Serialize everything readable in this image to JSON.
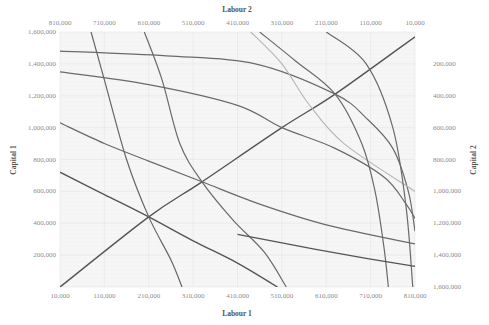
{
  "chart_data": {
    "type": "line",
    "title": "",
    "subtitle": "Edgeworth box: isoquants for two producers with contract curve",
    "xlabel": "Labour 1",
    "ylabel": "Capital 1",
    "x2label": "Labour 2",
    "y2label": "Capital 2",
    "xlim": [
      10000,
      810000
    ],
    "ylim": [
      0,
      1600000
    ],
    "x2lim": [
      810000,
      10000
    ],
    "y2lim": [
      1600000,
      0
    ],
    "grid": true,
    "legend": "none",
    "x_ticks": [
      "10,000",
      "110,000",
      "210,000",
      "310,000",
      "410,000",
      "510,000",
      "610,000",
      "710,000",
      "810,000"
    ],
    "y_ticks": [
      "",
      "200,000",
      "400,000",
      "600,000",
      "800,000",
      "1,000,000",
      "1,200,000",
      "1,400,000",
      "1,600,000"
    ],
    "x2_ticks": [
      "810,000",
      "710,000",
      "610,000",
      "510,000",
      "410,000",
      "310,000",
      "210,000",
      "110,000",
      "10,000"
    ],
    "y2_ticks": [
      "",
      "200,000",
      "400,000",
      "600,000",
      "800,000",
      "1,000,000",
      "1,200,000",
      "1,400,000",
      "1,600,000"
    ],
    "series": [
      {
        "name": "Contract curve",
        "color": "#555555",
        "width": 1.4,
        "points": [
          [
            10000,
            0
          ],
          [
            210000,
            440000
          ],
          [
            330000,
            660000
          ],
          [
            510000,
            1000000
          ],
          [
            630000,
            1210000
          ],
          [
            810000,
            1570000
          ]
        ]
      },
      {
        "name": "Isoquant 1a",
        "color": "#555555",
        "width": 1.4,
        "points": [
          [
            10000,
            720000
          ],
          [
            110000,
            580000
          ],
          [
            210000,
            440000
          ],
          [
            310000,
            290000
          ],
          [
            410000,
            150000
          ],
          [
            500000,
            0
          ]
        ]
      },
      {
        "name": "Isoquant 1b",
        "color": "#6a6a6a",
        "width": 1.2,
        "points": [
          [
            10000,
            1030000
          ],
          [
            110000,
            900000
          ],
          [
            210000,
            790000
          ],
          [
            330000,
            660000
          ],
          [
            460000,
            520000
          ],
          [
            610000,
            390000
          ],
          [
            810000,
            270000
          ]
        ]
      },
      {
        "name": "Isoquant 1c",
        "color": "#6a6a6a",
        "width": 1.2,
        "points": [
          [
            10000,
            1350000
          ],
          [
            210000,
            1270000
          ],
          [
            410000,
            1140000
          ],
          [
            510000,
            1000000
          ],
          [
            630000,
            870000
          ],
          [
            740000,
            690000
          ],
          [
            790000,
            520000
          ],
          [
            810000,
            430000
          ]
        ]
      },
      {
        "name": "Isoquant 1d",
        "color": "#6a6a6a",
        "width": 1.2,
        "points": [
          [
            10000,
            1480000
          ],
          [
            250000,
            1450000
          ],
          [
            450000,
            1400000
          ],
          [
            630000,
            1210000
          ],
          [
            700000,
            1060000
          ],
          [
            760000,
            870000
          ],
          [
            795000,
            600000
          ],
          [
            810000,
            350000
          ]
        ]
      },
      {
        "name": "Isoquant 2a",
        "color": "#666666",
        "width": 1.2,
        "points": [
          [
            80000,
            1600000
          ],
          [
            110000,
            1300000
          ],
          [
            160000,
            800000
          ],
          [
            210000,
            440000
          ],
          [
            260000,
            170000
          ],
          [
            285000,
            0
          ]
        ]
      },
      {
        "name": "Isoquant 2b",
        "color": "#6a6a6a",
        "width": 1.2,
        "points": [
          [
            200000,
            1600000
          ],
          [
            240000,
            1300000
          ],
          [
            280000,
            900000
          ],
          [
            330000,
            660000
          ],
          [
            400000,
            420000
          ],
          [
            470000,
            220000
          ],
          [
            520000,
            0
          ]
        ]
      },
      {
        "name": "Isoquant 2c",
        "color": "#b5b5b5",
        "width": 1.1,
        "points": [
          [
            440000,
            1600000
          ],
          [
            510000,
            1400000
          ],
          [
            570000,
            1150000
          ],
          [
            650000,
            900000
          ],
          [
            810000,
            600000
          ]
        ]
      },
      {
        "name": "Isoquant 2d",
        "color": "#6a6a6a",
        "width": 1.2,
        "points": [
          [
            460000,
            1600000
          ],
          [
            540000,
            1420000
          ],
          [
            630000,
            1210000
          ],
          [
            690000,
            900000
          ],
          [
            720000,
            600000
          ],
          [
            740000,
            250000
          ],
          [
            750000,
            0
          ]
        ]
      },
      {
        "name": "Isoquant 2e",
        "color": "#6a6a6a",
        "width": 1.2,
        "points": [
          [
            610000,
            1600000
          ],
          [
            700000,
            1400000
          ],
          [
            760000,
            1000000
          ],
          [
            790000,
            500000
          ],
          [
            805000,
            0
          ]
        ]
      },
      {
        "name": "Isoquant 1e",
        "color": "#555555",
        "width": 1.3,
        "points": [
          [
            410000,
            330000
          ],
          [
            560000,
            250000
          ],
          [
            700000,
            180000
          ],
          [
            810000,
            130000
          ]
        ]
      }
    ]
  }
}
